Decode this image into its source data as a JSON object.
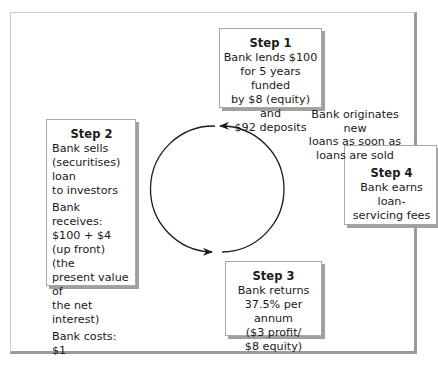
{
  "diagram": {
    "steps": [
      {
        "title": "Step 1",
        "lines": [
          "Bank lends $100",
          "for 5 years funded",
          "by $8 (equity) and",
          "$92 deposits"
        ]
      },
      {
        "title": "Step 2",
        "lines": [
          "Bank sells",
          "(securitises) loan",
          "to investors",
          "Bank receives:",
          "$100 + $4",
          "(up front) (the",
          "present value of",
          "the net interest)",
          "Bank costs: $1"
        ]
      },
      {
        "title": "Step 3",
        "lines": [
          "Bank returns",
          "37.5% per annum",
          "($3 profit/",
          "$8 equity)"
        ]
      },
      {
        "title": "Step 4",
        "lines": [
          "Bank earns loan-",
          "servicing fees"
        ]
      }
    ],
    "note": [
      "Bank originates new",
      "loans as soon as",
      "loans are sold"
    ],
    "cycle": {
      "direction": "counter-clockwise",
      "from": "Step 1",
      "to": "Step 2 → Step 3",
      "arrowheads": [
        "top",
        "bottom"
      ]
    },
    "colors": {
      "stroke": "#1a1a1a",
      "box_border": "#a8a8a8",
      "shadow": "#a0a0a0",
      "frame": "#9a9a9a"
    }
  }
}
